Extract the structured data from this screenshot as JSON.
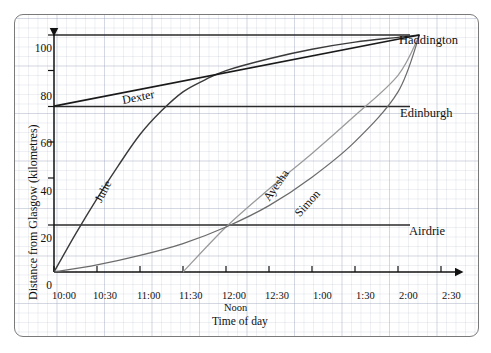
{
  "chart_data": {
    "type": "line",
    "title": "",
    "xlabel": "Time of day",
    "ylabel": "Distance from Glasgow (kilometres)",
    "xticks": [
      "10:00",
      "10:30",
      "11:00",
      "11:30",
      "12:00",
      "12:30",
      "1:00",
      "1:30",
      "2:00",
      "2:30"
    ],
    "xtick_sub": "Noon",
    "yticks": [
      0,
      20,
      40,
      60,
      80,
      100
    ],
    "ylim": [
      0,
      108
    ],
    "grid": true,
    "grid_style": "graph-paper",
    "legend_position": "inline-curve-labels",
    "reference_lines": [
      {
        "name": "Haddington",
        "value": 100,
        "label": "Haddington"
      },
      {
        "name": "Edinburgh",
        "value": 70,
        "label": "Edinburgh"
      },
      {
        "name": "Airdrie",
        "value": 20,
        "label": "Airdrie"
      }
    ],
    "series": [
      {
        "name": "Julie",
        "label": "Julie",
        "color": "#3a3a3a",
        "points": [
          {
            "x": "10:00",
            "y": 0
          },
          {
            "x": "10:15",
            "y": 16
          },
          {
            "x": "10:30",
            "y": 31
          },
          {
            "x": "10:45",
            "y": 45
          },
          {
            "x": "11:00",
            "y": 58
          },
          {
            "x": "11:15",
            "y": 68
          },
          {
            "x": "11:30",
            "y": 76
          },
          {
            "x": "11:45",
            "y": 81
          },
          {
            "x": "12:00",
            "y": 85
          },
          {
            "x": "12:30",
            "y": 90
          },
          {
            "x": "1:00",
            "y": 94
          },
          {
            "x": "1:30",
            "y": 97
          },
          {
            "x": "2:00",
            "y": 99
          },
          {
            "x": "2:15",
            "y": 100
          }
        ]
      },
      {
        "name": "Dexter",
        "label": "Dexter",
        "color": "#1a1a1a",
        "points": [
          {
            "x": "10:00",
            "y": 70
          },
          {
            "x": "2:15",
            "y": 100
          }
        ]
      },
      {
        "name": "Ayesha",
        "label": "Ayesha",
        "color": "#6b6b6b",
        "points": [
          {
            "x": "10:00",
            "y": 0
          },
          {
            "x": "10:30",
            "y": 3
          },
          {
            "x": "11:00",
            "y": 7
          },
          {
            "x": "11:30",
            "y": 12
          },
          {
            "x": "12:00",
            "y": 19
          },
          {
            "x": "12:30",
            "y": 28
          },
          {
            "x": "1:00",
            "y": 40
          },
          {
            "x": "1:30",
            "y": 55
          },
          {
            "x": "2:00",
            "y": 76
          },
          {
            "x": "2:15",
            "y": 100
          }
        ]
      },
      {
        "name": "Simon",
        "label": "Simon",
        "color": "#9a9a9a",
        "points": [
          {
            "x": "11:30",
            "y": 0
          },
          {
            "x": "12:00",
            "y": 19
          },
          {
            "x": "12:30",
            "y": 35
          },
          {
            "x": "1:00",
            "y": 50
          },
          {
            "x": "1:30",
            "y": 66
          },
          {
            "x": "2:00",
            "y": 83
          },
          {
            "x": "2:15",
            "y": 100
          }
        ]
      }
    ]
  }
}
